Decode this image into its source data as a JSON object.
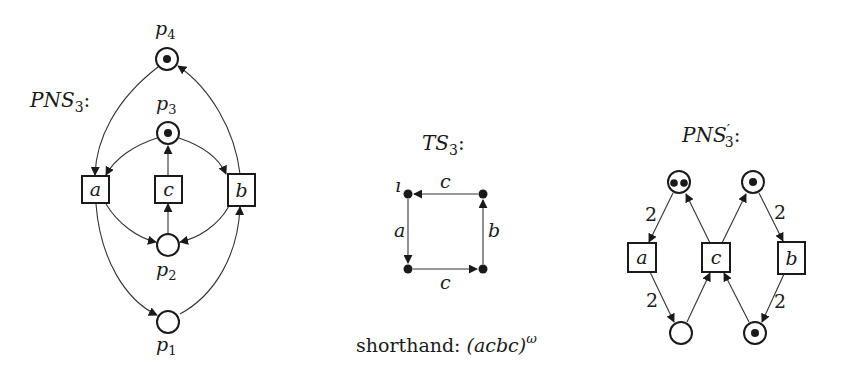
{
  "pns3": {
    "title": "PNS",
    "title_sub": "3",
    "title_suffix": ":",
    "places": [
      {
        "id": "p1",
        "label": "p",
        "sub": "1",
        "tokens": 0
      },
      {
        "id": "p2",
        "label": "p",
        "sub": "2",
        "tokens": 0
      },
      {
        "id": "p3",
        "label": "p",
        "sub": "3",
        "tokens": 1
      },
      {
        "id": "p4",
        "label": "p",
        "sub": "4",
        "tokens": 1
      }
    ],
    "transitions": [
      {
        "id": "a",
        "label": "a"
      },
      {
        "id": "c",
        "label": "c"
      },
      {
        "id": "b",
        "label": "b"
      }
    ],
    "arcs": [
      {
        "from": "p4",
        "to": "a"
      },
      {
        "from": "b",
        "to": "p4"
      },
      {
        "from": "p3",
        "to": "a"
      },
      {
        "from": "p3",
        "to": "b"
      },
      {
        "from": "c",
        "to": "p3"
      },
      {
        "from": "a",
        "to": "p2"
      },
      {
        "from": "b",
        "to": "p2"
      },
      {
        "from": "p2",
        "to": "c"
      },
      {
        "from": "a",
        "to": "p1"
      },
      {
        "from": "p1",
        "to": "b"
      }
    ]
  },
  "ts3": {
    "title": "TS",
    "title_sub": "3",
    "title_suffix": ":",
    "initial_label": "ı",
    "edges": [
      {
        "from": "top-left",
        "to": "bottom-left",
        "label": "a"
      },
      {
        "from": "bottom-left",
        "to": "bottom-right",
        "label": "c"
      },
      {
        "from": "bottom-right",
        "to": "top-right",
        "label": "b"
      },
      {
        "from": "top-right",
        "to": "top-left",
        "label": "c"
      }
    ],
    "shorthand_label": "shorthand: ",
    "shorthand_expr": "(acbc)",
    "shorthand_sup": "ω"
  },
  "pns3_prime": {
    "title": "PNS",
    "title_prime": "′",
    "title_sub": "3",
    "title_suffix": ":",
    "places": [
      {
        "id": "top-left",
        "tokens": 2
      },
      {
        "id": "top-right",
        "tokens": 1
      },
      {
        "id": "bottom-left",
        "tokens": 0
      },
      {
        "id": "bottom-right",
        "tokens": 1
      }
    ],
    "transitions": [
      {
        "id": "a",
        "label": "a"
      },
      {
        "id": "c",
        "label": "c"
      },
      {
        "id": "b",
        "label": "b"
      }
    ],
    "arc_weights": {
      "top_left_to_a": "2",
      "top_right_to_b": "2",
      "a_to_bottom_left": "2",
      "b_to_bottom_right": "2"
    }
  }
}
